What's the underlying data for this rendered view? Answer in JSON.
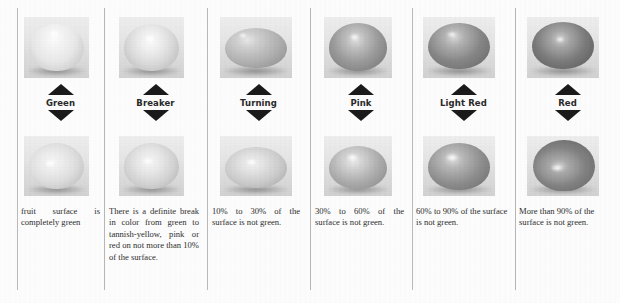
{
  "figure": {
    "kind": "tomato-ripeness-stage-chart",
    "column_count": 6,
    "columns": [
      {
        "stage_label": "Green",
        "description": "fruit surface is completely green",
        "top_photo_alt": "green tomato top view",
        "bottom_photo_alt": "green tomato side view",
        "fruit_tone_top": "#e8e7e0",
        "fruit_tone_bottom": "#dedcd3",
        "justify": true
      },
      {
        "stage_label": "Breaker",
        "description": "There is a definite break in color from green to tannish-yellow, pink or red on not more than 10% of the surface.",
        "top_photo_alt": "breaker stage tomato top view",
        "bottom_photo_alt": "breaker stage tomato side view",
        "fruit_tone_top": "#dcdbd3",
        "fruit_tone_bottom": "#d6d4cb",
        "justify": true
      },
      {
        "stage_label": "Turning",
        "description": "10% to 30% of the surface is not green.",
        "top_photo_alt": "turning stage tomato top view",
        "bottom_photo_alt": "turning stage tomato side view",
        "fruit_tone_top": "#b5b3ab",
        "fruit_tone_bottom": "#cfcdc4",
        "justify": true
      },
      {
        "stage_label": "Pink",
        "description": "30% to 60% of the surface is not green.",
        "top_photo_alt": "pink stage tomato top view",
        "bottom_photo_alt": "pink stage tomato side view",
        "fruit_tone_top": "#9b9991",
        "fruit_tone_bottom": "#b0aea6",
        "justify": true
      },
      {
        "stage_label": "Light Red",
        "description": "60% to 90% of the surface is not green.",
        "top_photo_alt": "light red stage tomato top view",
        "bottom_photo_alt": "light red stage tomato side view",
        "fruit_tone_top": "#8a8880",
        "fruit_tone_bottom": "#93918a",
        "justify": false
      },
      {
        "stage_label": "Red",
        "description": "More than 90% of the surface is not green.",
        "top_photo_alt": "red stage tomato top view",
        "bottom_photo_alt": "red stage tomato side view",
        "fruit_tone_top": "#7e7c75",
        "fruit_tone_bottom": "#86847d",
        "justify": false
      }
    ],
    "colors": {
      "divider": "#b9b9b9",
      "arrow": "#1b1b1b",
      "text": "#2e2e2e",
      "background": "#fdfdfd"
    }
  }
}
